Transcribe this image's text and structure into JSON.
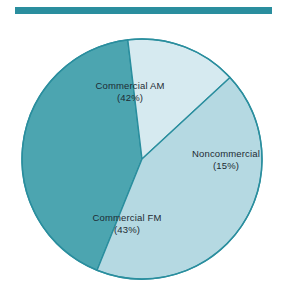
{
  "figure": {
    "clipped_caption": "''",
    "rule_color": "#2a8e9e",
    "background": "#ffffff",
    "label_color": "#1d2b33"
  },
  "chart_data": {
    "type": "pie",
    "title": "",
    "subtitle": "",
    "xlabel": "",
    "ylabel": "",
    "legend_position": "none",
    "grid": false,
    "total_percent": 100,
    "categories": [
      "Commercial AM",
      "Noncommercial",
      "Commercial FM"
    ],
    "values": [
      42,
      15,
      43
    ],
    "slices": [
      {
        "name": "Commercial AM",
        "value": 42,
        "percent_text": "(42%)",
        "color": "#4ca5b0",
        "start_angle_deg": 202,
        "end_angle_deg": 353.2
      },
      {
        "name": "Noncommercial",
        "value": 15,
        "percent_text": "(15%)",
        "color": "#d6eaf0",
        "start_angle_deg": 353.2,
        "end_angle_deg": 407.2
      },
      {
        "name": "Commercial FM",
        "value": 43,
        "percent_text": "(43%)",
        "color": "#b5d9e2",
        "start_angle_deg": 47.2,
        "end_angle_deg": 202
      }
    ],
    "geometry": {
      "center_x": 142,
      "center_y": 159,
      "radius": 120,
      "stroke_color": "#2a8e9e",
      "stroke_width": 1.4
    }
  },
  "labels": {
    "commercial_am": {
      "name": "Commercial AM",
      "percent": "(42%)"
    },
    "noncommercial": {
      "name": "Noncommercial",
      "percent": "(15%)"
    },
    "commercial_fm": {
      "name": "Commercial FM",
      "percent": "(43%)"
    }
  }
}
